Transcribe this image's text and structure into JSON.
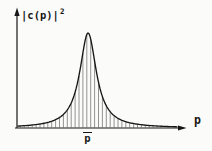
{
  "figure": {
    "background": "#fbfbf9",
    "ink_color": "#161616",
    "hatch_color": "#3a3a3a",
    "y_axis_label": {
      "base": "|c(p)|",
      "exponent": "2"
    },
    "x_axis_label": "p",
    "peak_label": {
      "text": "p",
      "overline": true,
      "rendered": "p̄"
    }
  },
  "chart_data": {
    "type": "area",
    "title": "",
    "xlabel": "p",
    "ylabel": "|c(p)|²",
    "grid": false,
    "legend": null,
    "x_axis": {
      "arrow": true,
      "ticks": [],
      "range_normalized": [
        0,
        1
      ]
    },
    "y_axis": {
      "arrow": true,
      "ticks": [],
      "range_normalized": [
        0,
        1
      ]
    },
    "curve": {
      "shape": "lorentzian",
      "center": 0.423,
      "hwhm": 0.06,
      "peak": 1.0
    },
    "x": [
      0.0,
      0.05,
      0.1,
      0.15,
      0.2,
      0.25,
      0.3,
      0.35,
      0.38,
      0.4,
      0.423,
      0.45,
      0.47,
      0.5,
      0.55,
      0.6,
      0.65,
      0.7,
      0.8,
      0.9,
      1.0
    ],
    "y": [
      0.02,
      0.025,
      0.033,
      0.046,
      0.068,
      0.107,
      0.192,
      0.403,
      0.661,
      0.872,
      1.0,
      0.832,
      0.62,
      0.378,
      0.182,
      0.103,
      0.065,
      0.045,
      0.025,
      0.016,
      0.011
    ],
    "fill": "vertical-hatch",
    "annotations": [
      {
        "x": 0.423,
        "label": "p̄",
        "position": "below-x-axis"
      }
    ]
  }
}
